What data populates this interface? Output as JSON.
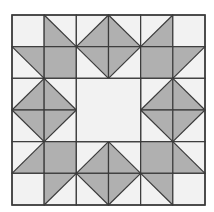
{
  "diagram": {
    "type": "quilt-block",
    "grid": {
      "rows": 6,
      "cols": 6,
      "x0": 12,
      "y0": 15,
      "x1": 205,
      "y1": 205
    },
    "colors": {
      "background": "#ffffff",
      "light": "#f2f2f2",
      "dark": "#b0b0b0",
      "line": "#3a3a3a"
    },
    "center": {
      "row": 2,
      "col": 2,
      "span": 2,
      "fill": "light"
    },
    "cells": [
      [
        "P",
        "D/bl",
        "U/br",
        "D/bl",
        "U/br",
        "P"
      ],
      [
        "D/tr",
        "S",
        "D/tr",
        "U/tl",
        "S",
        "U/tl"
      ],
      [
        "U/br",
        "D/bl",
        "C",
        "C",
        "U/br",
        "D/bl"
      ],
      [
        "D/tr",
        "U/tl",
        "C",
        "C",
        "D/tr",
        "U/tl"
      ],
      [
        "U/br",
        "S",
        "U/br",
        "D/bl",
        "S",
        "D/bl"
      ],
      [
        "P",
        "U/tl",
        "D/tr",
        "U/tl",
        "D/tr",
        "P"
      ]
    ],
    "legend": {
      "P": "plain light square",
      "S": "solid dark square",
      "C": "merged center square",
      "D": "diagonal top-left to bottom-right",
      "U": "diagonal bottom-left to top-right",
      "bl/br/tl/tr": "which triangle is dark"
    }
  }
}
